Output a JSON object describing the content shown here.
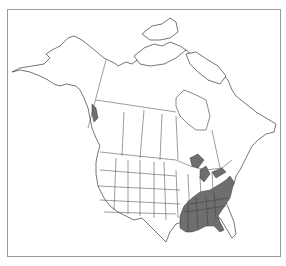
{
  "map": {
    "type": "species-range-map",
    "region": "North America",
    "title": "",
    "colors": {
      "background": "#ffffff",
      "border": "#9a9a9a",
      "outline": "#3a3a3a",
      "range_fill": "#6e6e6e"
    },
    "range": {
      "label": "Distribution range",
      "description": "Southeastern United States",
      "shaded_regions": [
        "Louisiana",
        "Mississippi",
        "Alabama",
        "Georgia",
        "Florida (north)",
        "South Carolina",
        "North Carolina",
        "Tennessee",
        "Kentucky",
        "Arkansas (east)",
        "Virginia",
        "Maryland",
        "Delaware",
        "Michigan (Upper Peninsula)",
        "Pacific Northwest coastal islands"
      ]
    }
  }
}
